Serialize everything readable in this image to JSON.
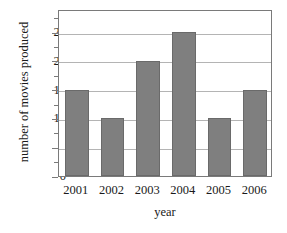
{
  "chart_data": {
    "type": "bar",
    "title": "",
    "categories": [
      "2001",
      "2002",
      "2003",
      "2004",
      "2005",
      "2006"
    ],
    "values": [
      15,
      10,
      20,
      25,
      10,
      15
    ],
    "xlabel": "year",
    "ylabel": "number of movies produced",
    "ylim": [
      0,
      29
    ],
    "ytick_labels": [
      "0",
      "5",
      "10",
      "15",
      "20",
      "25"
    ],
    "ytick_values": [
      0,
      5,
      10,
      15,
      20,
      25
    ],
    "yminor_values": [
      2.5,
      7.5,
      12.5,
      17.5,
      22.5,
      27.5
    ],
    "gridlines": "horizontal-major",
    "legend": "none",
    "bar_color": "#7f7f7f",
    "bar_edge_color": "#6a6a6a",
    "grid_color": "#b4b4b4",
    "frame_color": "#7a7a7a",
    "background": "#ffffff"
  }
}
